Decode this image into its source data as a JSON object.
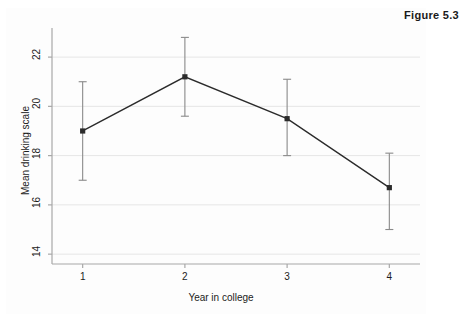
{
  "figure": {
    "caption": "Figure 5.3"
  },
  "chart_data": {
    "type": "line",
    "title": "",
    "xlabel": "Year in college",
    "ylabel": "Mean drinking scale",
    "x": [
      1,
      2,
      3,
      4
    ],
    "xtick_labels": [
      "1",
      "2",
      "3",
      "4"
    ],
    "xlim": [
      0.7,
      4.3
    ],
    "values": [
      19.0,
      21.2,
      19.5,
      16.7
    ],
    "error_low": [
      17.0,
      19.6,
      18.0,
      15.0
    ],
    "error_high": [
      21.0,
      22.8,
      21.1,
      18.1
    ],
    "ylim": [
      13.6,
      23.1
    ],
    "ytick_values": [
      14,
      16,
      18,
      20,
      22
    ],
    "ytick_labels": [
      "14",
      "16",
      "18",
      "20",
      "22"
    ],
    "grid": true,
    "grid_axis": "y",
    "legend": "none",
    "series": [
      {
        "name": "Mean drinking scale",
        "values": [
          19.0,
          21.2,
          19.5,
          16.7
        ],
        "error_low": [
          17.0,
          19.6,
          18.0,
          15.0
        ],
        "error_high": [
          21.0,
          22.8,
          21.1,
          18.1
        ],
        "marker": "square",
        "color": "#2b2b2b"
      }
    ],
    "colors": {
      "line": "#2b2b2b",
      "marker": "#2b2b2b",
      "errorbar": "#8a8a8a",
      "grid": "#e6e6e6",
      "axis": "#a8a8a8",
      "text": "#1c1c1c"
    }
  }
}
